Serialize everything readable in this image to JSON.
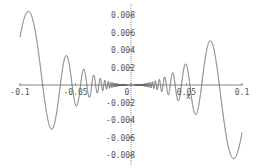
{
  "chart_data": {
    "type": "line",
    "title": "",
    "function": "x^2 * sin(1/x)",
    "xlabel": "x",
    "ylabel": "",
    "xlim": [
      -0.1,
      0.1
    ],
    "ylim": [
      -0.009,
      0.009
    ],
    "grid": false,
    "legend": null,
    "x_ticks": [
      {
        "value": -0.1,
        "label": "-0.1"
      },
      {
        "value": -0.05,
        "label": "-0.05"
      },
      {
        "value": 0,
        "label": "0"
      },
      {
        "value": 0.05,
        "label": "0.05"
      },
      {
        "value": 0.1,
        "label": "0.1"
      }
    ],
    "y_ticks": [
      {
        "value": 0.008,
        "label": "0.008"
      },
      {
        "value": 0.006,
        "label": "0.006"
      },
      {
        "value": 0.004,
        "label": "0.004"
      },
      {
        "value": 0.002,
        "label": "0.002"
      },
      {
        "value": 0,
        "label": "0"
      },
      {
        "value": -0.002,
        "label": "-0.002"
      },
      {
        "value": -0.004,
        "label": "-0.004"
      },
      {
        "value": -0.006,
        "label": "-0.006"
      },
      {
        "value": -0.008,
        "label": "-0.008"
      }
    ],
    "series": [
      {
        "name": "f(x)",
        "color": "#666666",
        "key_points": [
          {
            "x": -0.1,
            "y": 0.00544
          },
          {
            "x": -0.093,
            "y": 0.0086
          },
          {
            "x": -0.073,
            "y": -0.0051
          },
          {
            "x": -0.062,
            "y": 0.0033
          },
          {
            "x": -0.053,
            "y": -0.0025
          },
          {
            "x": -0.045,
            "y": 0.0017
          },
          {
            "x": 0,
            "y": 0
          },
          {
            "x": 0.045,
            "y": -0.0017
          },
          {
            "x": 0.053,
            "y": 0.0025
          },
          {
            "x": 0.062,
            "y": -0.0033
          },
          {
            "x": 0.073,
            "y": 0.0051
          },
          {
            "x": 0.093,
            "y": -0.0086
          },
          {
            "x": 0.1,
            "y": -0.00544
          }
        ]
      }
    ]
  },
  "layout": {
    "x_axis_label": "x",
    "axis_color": "#888888",
    "curve_color": "#666666"
  }
}
